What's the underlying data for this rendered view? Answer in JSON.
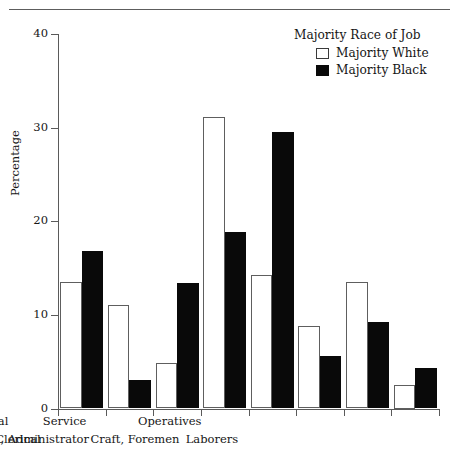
{
  "chart_data": {
    "type": "bar",
    "title": "",
    "xlabel": "",
    "ylabel": "Percentage",
    "ylim": [
      0,
      40
    ],
    "yticks": [
      0,
      10,
      20,
      30,
      40
    ],
    "ytick_labels": [
      "0",
      "10",
      "20",
      "30",
      "40"
    ],
    "grid": false,
    "legend_position": "top-right",
    "legend_title": "Majority Race of Job",
    "categories": [
      "Professional and Technical",
      "Manager, Official, Administrator",
      "Sales",
      "Clerical",
      "Service",
      "Craft, Foremen",
      "Operatives",
      "Laborers"
    ],
    "series": [
      {
        "name": "Majority White",
        "color": "#ffffff",
        "edge_color": "#5e5e5e",
        "values": [
          13.5,
          11.1,
          4.9,
          31.1,
          14.3,
          8.8,
          13.5,
          2.5
        ]
      },
      {
        "name": "Majority Black",
        "color": "#090909",
        "edge_color": "#090909",
        "values": [
          16.8,
          3.0,
          13.4,
          18.9,
          29.5,
          5.6,
          9.2,
          4.3
        ]
      }
    ]
  },
  "axes": {
    "y_title": "Percentage",
    "y_labels": [
      "40",
      "30",
      "20",
      "10",
      "0"
    ]
  },
  "legend": {
    "title": "Majority Race of Job",
    "entries": [
      {
        "label": "Majority White",
        "swatch": "hollow-square-swatch"
      },
      {
        "label": "Majority Black",
        "swatch": "filled-square-swatch"
      }
    ]
  },
  "x_axis_labels": {
    "row_top": [
      "Professional and Technical",
      "Sales",
      "Service",
      "Operatives"
    ],
    "row_bottom": [
      "Manager, Official, Administrator",
      "Clerical",
      "Craft, Foremen",
      "Laborers"
    ]
  }
}
